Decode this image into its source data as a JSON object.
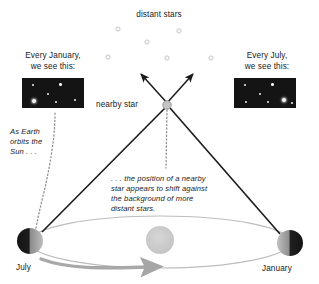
{
  "diagram": {
    "title_top": "distant stars",
    "nearby_star_label": "nearby star",
    "left_caption_line1": "Every January,",
    "left_caption_line2": "we see this:",
    "right_caption_line1": "Every July,",
    "right_caption_line2": "we see this:",
    "left_note_line1": "As Earth",
    "left_note_line2": "orbits the",
    "left_note_line3": "Sun . . .",
    "center_note_line1": ". . . the position of a nearby",
    "center_note_line2": "star appears to shift against",
    "center_note_line3": "the background of more",
    "center_note_line4": "distant stars.",
    "label_july": "July",
    "label_january": "January"
  },
  "colors": {
    "ink": "#111111",
    "line_dark": "#1a1a1a",
    "orbit_gray": "#b9b9b9",
    "orbit_arrow_gray": "#9d9d9d",
    "sun_gray": "#c9c9c9",
    "star_gray": "#bdbdbd",
    "distant_star_outline": "#c6c6c6",
    "photo_bg": "#141414",
    "earth_dark": "#1b1b1b",
    "earth_light": "#b0b0b0"
  },
  "chart_data": {
    "type": "diagram",
    "distant_stars": [
      {
        "x": 118,
        "y": 29
      },
      {
        "x": 179,
        "y": 31
      },
      {
        "x": 147,
        "y": 42
      },
      {
        "x": 108,
        "y": 57
      },
      {
        "x": 167,
        "y": 58
      },
      {
        "x": 211,
        "y": 58
      }
    ],
    "nearby_star": {
      "x": 167,
      "y": 105,
      "r": 4.2
    },
    "sun": {
      "x": 160,
      "y": 240,
      "r": 14
    },
    "earth_july": {
      "x": 30,
      "y": 241,
      "r": 13,
      "lit_side": "right"
    },
    "earth_january": {
      "x": 290,
      "y": 243,
      "r": 13,
      "lit_side": "left"
    },
    "orbit": {
      "cx": 160,
      "cy": 242,
      "rx": 130,
      "ry": 26
    },
    "sight_lines": [
      {
        "from": "earth_july",
        "to": "nearby_star"
      },
      {
        "from": "earth_january",
        "to": "nearby_star"
      }
    ],
    "apparent_shift_arrows": [
      {
        "x1": 167,
        "y1": 105,
        "x2": 141,
        "y2": 74
      },
      {
        "x1": 167,
        "y1": 105,
        "x2": 194,
        "y2": 74
      }
    ],
    "left_photo": {
      "x": 22,
      "y": 78,
      "w": 62,
      "h": 30,
      "stars": [
        {
          "x": 0.17,
          "y": 0.24,
          "r": 1.0
        },
        {
          "x": 0.62,
          "y": 0.22,
          "r": 1.3
        },
        {
          "x": 0.42,
          "y": 0.52,
          "r": 1.0
        },
        {
          "x": 0.2,
          "y": 0.78,
          "r": 2.1,
          "bright": true
        },
        {
          "x": 0.55,
          "y": 0.8,
          "r": 1.0
        },
        {
          "x": 0.86,
          "y": 0.74,
          "r": 1.0
        }
      ]
    },
    "right_photo": {
      "x": 234,
      "y": 78,
      "w": 62,
      "h": 30,
      "stars": [
        {
          "x": 0.17,
          "y": 0.24,
          "r": 1.0
        },
        {
          "x": 0.62,
          "y": 0.22,
          "r": 1.3
        },
        {
          "x": 0.42,
          "y": 0.52,
          "r": 1.0
        },
        {
          "x": 0.2,
          "y": 0.8,
          "r": 1.0
        },
        {
          "x": 0.55,
          "y": 0.8,
          "r": 1.0
        },
        {
          "x": 0.8,
          "y": 0.74,
          "r": 2.1,
          "bright": true
        },
        {
          "x": 0.93,
          "y": 0.84,
          "r": 0.9
        }
      ]
    }
  }
}
